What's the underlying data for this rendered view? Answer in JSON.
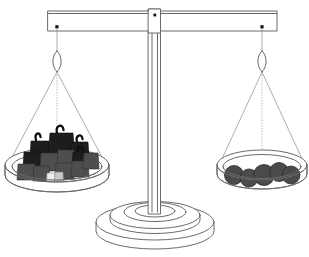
{
  "illustration": {
    "title": "Balance scale",
    "description": "Two-pan beam balance with weights on the left pan and round discs on the right pan",
    "state": "level",
    "background_color": "#ffffff",
    "outline_color": "#6b6b6b",
    "cord_color": "#8a8a8a"
  },
  "beam": {
    "label": "balance-beam",
    "x": 48,
    "y": 11,
    "width": 229,
    "height": 20,
    "tilt_degrees": 0,
    "left_pivot": {
      "x": 57,
      "y": 27
    },
    "right_pivot": {
      "x": 262,
      "y": 27
    },
    "center_pivot": {
      "x": 155,
      "y": 15
    }
  },
  "column": {
    "label": "center-post",
    "x": 148,
    "y": 8,
    "width": 13,
    "height": 212,
    "color": "#f4f4f4"
  },
  "base": {
    "label": "pedestal-base",
    "center_x": 155,
    "center_y": 225,
    "tiers": 3,
    "outer_radius_x": 60,
    "outer_radius_y": 18
  },
  "left_pan": {
    "label": "left-pan",
    "center_x": 57,
    "rim_y": 165,
    "rim_radius_x": 52,
    "rim_radius_y": 17,
    "depth": 28,
    "hanger_y": 58,
    "contents_label": "iron weights with handles",
    "contents_count": 14,
    "weights": [
      {
        "id": "w1",
        "kind": "handled-block",
        "shade": "dark",
        "x": 31,
        "y": 139,
        "w": 19,
        "h": 19,
        "handle": true
      },
      {
        "id": "w2",
        "kind": "handled-block",
        "shade": "dark",
        "x": 50,
        "y": 131,
        "w": 23,
        "h": 24,
        "handle": true
      },
      {
        "id": "w3",
        "kind": "handled-block",
        "shade": "dark",
        "x": 71,
        "y": 140,
        "w": 17,
        "h": 18,
        "handle": true
      },
      {
        "id": "w4",
        "kind": "block",
        "shade": "dark",
        "x": 24,
        "y": 151,
        "w": 18,
        "h": 17,
        "handle": false
      },
      {
        "id": "w5",
        "kind": "block",
        "shade": "mid",
        "x": 41,
        "y": 152,
        "w": 17,
        "h": 19,
        "handle": false
      },
      {
        "id": "w6",
        "kind": "block",
        "shade": "mid",
        "x": 58,
        "y": 149,
        "w": 16,
        "h": 18,
        "handle": false
      },
      {
        "id": "w7",
        "kind": "handled-block",
        "shade": "dark",
        "x": 73,
        "y": 150,
        "w": 16,
        "h": 17,
        "handle": true
      },
      {
        "id": "w8",
        "kind": "block",
        "shade": "mid",
        "x": 18,
        "y": 163,
        "w": 17,
        "h": 17,
        "handle": false
      },
      {
        "id": "w9",
        "kind": "block",
        "shade": "mid",
        "x": 34,
        "y": 165,
        "w": 15,
        "h": 16,
        "handle": false
      },
      {
        "id": "w10",
        "kind": "block",
        "shade": "mid",
        "x": 56,
        "y": 162,
        "w": 17,
        "h": 17,
        "handle": false
      },
      {
        "id": "w11",
        "kind": "block",
        "shade": "mid",
        "x": 72,
        "y": 160,
        "w": 16,
        "h": 17,
        "handle": false
      },
      {
        "id": "w12",
        "kind": "block",
        "shade": "mid",
        "x": 84,
        "y": 152,
        "w": 14,
        "h": 16,
        "handle": false
      },
      {
        "id": "w13",
        "kind": "small-block",
        "shade": "pale",
        "x": 47,
        "y": 172,
        "w": 8,
        "h": 8,
        "handle": false
      },
      {
        "id": "w14",
        "kind": "small-block",
        "shade": "light",
        "x": 55,
        "y": 171,
        "w": 8,
        "h": 9,
        "handle": false
      }
    ]
  },
  "right_pan": {
    "label": "right-pan",
    "center_x": 262,
    "rim_y": 165,
    "rim_radius_x": 45,
    "rim_radius_y": 15,
    "depth": 26,
    "hanger_y": 58,
    "contents_label": "round discs",
    "contents_count": 5,
    "disc_color": "#4a4a4a",
    "discs": [
      {
        "id": "d1",
        "cx": 234,
        "cy": 175,
        "r": 9.5
      },
      {
        "id": "d2",
        "cx": 249,
        "cy": 178,
        "r": 9.0
      },
      {
        "id": "d3",
        "cx": 264,
        "cy": 175,
        "r": 10.5
      },
      {
        "id": "d4",
        "cx": 279,
        "cy": 172,
        "r": 9.5
      },
      {
        "id": "d5",
        "cx": 291,
        "cy": 175,
        "r": 9.0
      }
    ]
  },
  "cords": {
    "label": "suspension-cords",
    "per_pan": 3,
    "style": "thin-line"
  }
}
